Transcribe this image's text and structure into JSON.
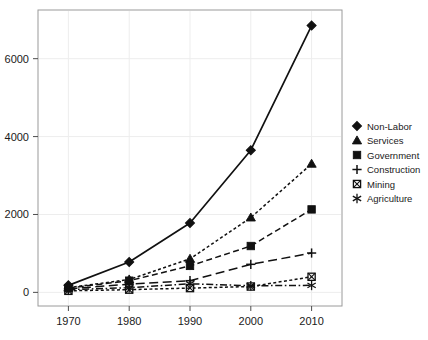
{
  "chart_data": {
    "type": "line",
    "title": "",
    "subtitle": "",
    "xlabel": "",
    "ylabel": "",
    "x": [
      1970,
      1980,
      1990,
      2000,
      2010
    ],
    "categories": [
      "1970",
      "1980",
      "1990",
      "2000",
      "2010"
    ],
    "xtick_labels": [
      "1970",
      "1980",
      "1990",
      "2000",
      "2010"
    ],
    "ytick_labels": [
      "0",
      "2000",
      "4000",
      "6000"
    ],
    "yticks": [
      0,
      2000,
      4000,
      6000
    ],
    "xlim": [
      1965,
      2015
    ],
    "ylim": [
      -350,
      7250
    ],
    "grid": true,
    "grid_color": "#ededed",
    "legend_position": "right",
    "background": "#ffffff",
    "frame_color": "#9a9a9a",
    "series": [
      {
        "name": "Non-Labor",
        "values": [
          180,
          780,
          1780,
          3650,
          6850
        ],
        "marker": "filled-diamond",
        "linestyle": "solid",
        "color": "#111111"
      },
      {
        "name": "Services",
        "values": [
          120,
          330,
          860,
          1920,
          3300
        ],
        "marker": "filled-triangle",
        "linestyle": "dotted",
        "color": "#111111"
      },
      {
        "name": "Government",
        "values": [
          110,
          300,
          680,
          1190,
          2130
        ],
        "marker": "filled-square",
        "linestyle": "dashed",
        "color": "#111111"
      },
      {
        "name": "Construction",
        "values": [
          90,
          210,
          300,
          720,
          1010
        ],
        "marker": "plus",
        "linestyle": "long-dash",
        "color": "#111111"
      },
      {
        "name": "Mining",
        "values": [
          40,
          70,
          110,
          150,
          400
        ],
        "marker": "crossed-square",
        "linestyle": "dotted",
        "color": "#111111"
      },
      {
        "name": "Agriculture",
        "values": [
          70,
          120,
          220,
          170,
          180
        ],
        "marker": "asterisk",
        "linestyle": "dash-dot",
        "color": "#111111"
      }
    ]
  },
  "legend": {
    "entries": [
      {
        "label": "Non-Labor",
        "marker": "filled-diamond"
      },
      {
        "label": "Services",
        "marker": "filled-triangle"
      },
      {
        "label": "Government",
        "marker": "filled-square"
      },
      {
        "label": "Construction",
        "marker": "plus"
      },
      {
        "label": "Mining",
        "marker": "crossed-square"
      },
      {
        "label": "Agriculture",
        "marker": "asterisk"
      }
    ]
  }
}
